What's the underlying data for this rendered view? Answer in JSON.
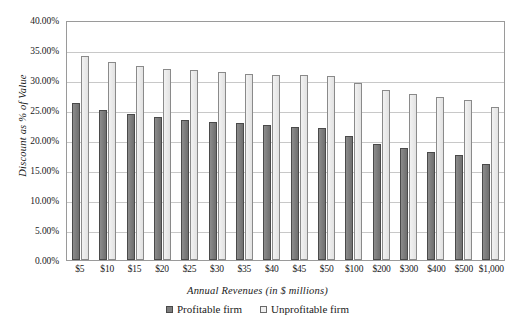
{
  "chart_data": {
    "type": "bar",
    "title": "",
    "xlabel": "Annual Revenues (in $ millions)",
    "ylabel": "Discount as % of Value",
    "categories": [
      "$5",
      "$10",
      "$15",
      "$20",
      "$25",
      "$30",
      "$35",
      "$40",
      "$45",
      "$50",
      "$100",
      "$200",
      "$300",
      "$400",
      "$500",
      "$1,000"
    ],
    "series": [
      {
        "name": "Profitable firm",
        "color": "#7d7d7d",
        "values": [
          26.2,
          25.0,
          24.4,
          23.8,
          23.3,
          23.0,
          22.8,
          22.5,
          22.2,
          22.0,
          20.6,
          19.3,
          18.6,
          18.0,
          17.5,
          16.0
        ]
      },
      {
        "name": "Unprofitable firm",
        "color": "#ececec",
        "values": [
          34.0,
          33.0,
          32.3,
          31.9,
          31.7,
          31.3,
          31.0,
          30.9,
          30.8,
          30.6,
          29.5,
          28.3,
          27.6,
          27.1,
          26.7,
          25.5
        ]
      }
    ],
    "ylim": [
      0,
      40
    ],
    "ytick_step": 5,
    "ytick_labels": [
      "0.00%",
      "5.00%",
      "10.00%",
      "15.00%",
      "20.00%",
      "25.00%",
      "30.00%",
      "35.00%",
      "40.00%"
    ],
    "grid": true,
    "legend_position": "bottom"
  }
}
